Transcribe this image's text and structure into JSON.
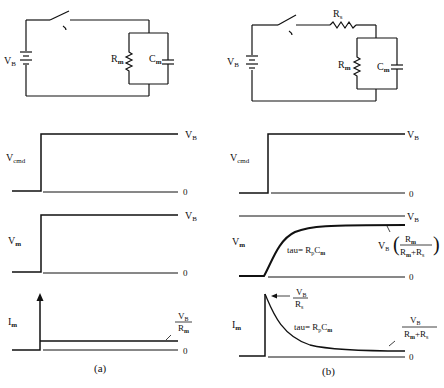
{
  "panel_a": {
    "circuit": {
      "battery_label": "V",
      "battery_sub": "B",
      "rm_label": "R",
      "rm_sub": "m",
      "cm_label": "C",
      "cm_sub": "m"
    },
    "vcmd": {
      "label": "V",
      "sub": "cmd",
      "high": "V",
      "high_sub": "B",
      "low": "0"
    },
    "vm": {
      "label": "V",
      "sub": "m",
      "high": "V",
      "high_sub": "B",
      "low": "0"
    },
    "im": {
      "label": "I",
      "sub": "m",
      "ss_num": "V",
      "ss_num_sub": "B",
      "ss_den": "R",
      "ss_den_sub": "m",
      "low": "0"
    },
    "caption": "(a)"
  },
  "panel_b": {
    "circuit": {
      "battery_label": "V",
      "battery_sub": "B",
      "rs_label": "R",
      "rs_sub": "s",
      "rm_label": "R",
      "rm_sub": "m",
      "cm_label": "C",
      "cm_sub": "m"
    },
    "vcmd": {
      "label": "V",
      "sub": "cmd",
      "high": "V",
      "high_sub": "B",
      "low": "0"
    },
    "vm": {
      "label": "V",
      "sub": "m",
      "high": "V",
      "high_sub": "B",
      "low": "0",
      "tau": "tau=  R",
      "tau_sub1": "p",
      "tau_c": "C",
      "tau_sub2": "m",
      "ss_prefix": "V",
      "ss_prefix_sub": "B",
      "ss_num": "R",
      "ss_num_sub": "m",
      "ss_den": "R",
      "ss_den_sub": "m",
      "ss_den_plus": "+R",
      "ss_den_sub2": "s"
    },
    "im": {
      "label": "I",
      "sub": "m",
      "low": "0",
      "peak_num": "V",
      "peak_num_sub": "B",
      "peak_den": "R",
      "peak_den_sub": "s",
      "tau": "tau=  R",
      "tau_sub1": "p",
      "tau_c": "C",
      "tau_sub2": "m",
      "ss_num": "V",
      "ss_num_sub": "B",
      "ss_den": "R",
      "ss_den_sub": "m",
      "ss_den_plus": "+R",
      "ss_den_sub2": "s"
    },
    "caption": "(b)"
  }
}
